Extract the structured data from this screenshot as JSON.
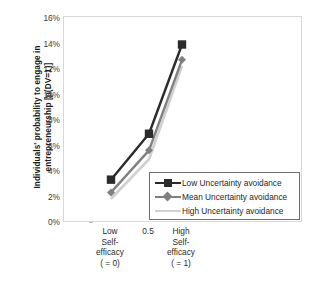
{
  "chart_data": {
    "type": "line",
    "title": "",
    "xlabel": "",
    "ylabel": "Individuals' probability to engage in entrepreneurship [p(DV=1)]",
    "categories": [
      "Low Self-efficacy ( = 0)",
      "0.5",
      "High Self-efficacy ( = 1)"
    ],
    "x": [
      0,
      0.5,
      1
    ],
    "ylim": [
      0,
      16
    ],
    "yunit": "%",
    "ytick_labels": [
      "0%",
      "2%",
      "4%",
      "6%",
      "8%",
      "10%",
      "12%",
      "14%",
      "16%"
    ],
    "ytick_values": [
      0,
      2,
      4,
      6,
      8,
      10,
      12,
      14,
      16
    ],
    "grid": false,
    "legend_position": "inside-bottom-right",
    "series": [
      {
        "name": "Low Uncertainty avoidance",
        "values": [
          3.4,
          7.0,
          14.0
        ],
        "color": "#2b2b2b",
        "marker": "square"
      },
      {
        "name": "Mean Uncertainty avoidance",
        "values": [
          2.4,
          5.7,
          12.8
        ],
        "color": "#808080",
        "marker": "diamond"
      },
      {
        "name": "High Uncertainty avoidance",
        "values": [
          1.9,
          5.0,
          12.3
        ],
        "color": "#d0d0d0",
        "marker": "none"
      }
    ]
  },
  "axis": {
    "y_title_line1": "Individuals' probability to engage in",
    "y_title_line2": "entrepreneurship [p(DV=1)]",
    "x_categories": [
      {
        "lines": [
          "Low",
          "Self-",
          "efficacy",
          "( = 0)"
        ]
      },
      {
        "lines": [
          "0.5"
        ]
      },
      {
        "lines": [
          "High",
          "Self-",
          "efficacy",
          "( = 1)"
        ]
      }
    ],
    "y_ticks": [
      "16%",
      "14%",
      "12%",
      "10%",
      "8%",
      "6%",
      "4%",
      "2%",
      "0%"
    ]
  },
  "legend": {
    "entries": [
      {
        "label": "Low Uncertainty avoidance",
        "color": "#2b2b2b",
        "marker": "square"
      },
      {
        "label": "Mean Uncertainty avoidance",
        "color": "#808080",
        "marker": "diamond"
      },
      {
        "label": "High Uncertainty avoidance",
        "color": "#d0d0d0",
        "marker": "none"
      }
    ]
  }
}
